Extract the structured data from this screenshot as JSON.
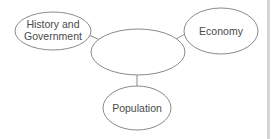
{
  "diagram": {
    "type": "concept-web",
    "colors": {
      "stroke": "#8a8a8a",
      "text": "#4a4a4a",
      "background": "#ffffff",
      "divider": "#d4d4d4"
    },
    "center_node": {
      "label": ""
    },
    "nodes": [
      {
        "id": "history",
        "line1": "History and",
        "line2": "Government"
      },
      {
        "id": "economy",
        "label": "Economy"
      },
      {
        "id": "population",
        "label": "Population"
      }
    ]
  }
}
